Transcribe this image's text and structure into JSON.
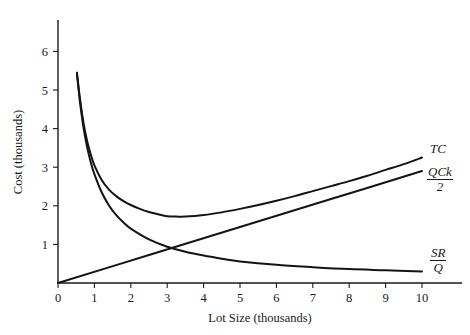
{
  "chart_data": {
    "type": "line",
    "title": "",
    "xlabel": "Lot Size (thousands)",
    "ylabel": "Cost (thousands)",
    "xlim": [
      0,
      11
    ],
    "ylim": [
      0,
      6.7
    ],
    "xticks": [
      "0",
      "1",
      "2",
      "3",
      "4",
      "5",
      "6",
      "7",
      "8",
      "9",
      "10"
    ],
    "yticks": [
      "1",
      "2",
      "3",
      "4",
      "5",
      "6"
    ],
    "grid": false,
    "legend_position": "right-inline",
    "series": [
      {
        "name": "TC",
        "label_text": "TC",
        "label_type": "plain",
        "description": "Total cost: U-shaped sum of holding and setup cost, minimum near lot size 3",
        "x": [
          0.52,
          0.6,
          0.7,
          0.8,
          0.9,
          1.0,
          1.2,
          1.4,
          1.6,
          1.8,
          2.0,
          2.25,
          2.5,
          2.75,
          3.0,
          3.25,
          3.5,
          4.0,
          4.5,
          5.0,
          5.5,
          6.0,
          6.5,
          7.0,
          7.5,
          8.0,
          8.5,
          9.0,
          9.5,
          10.0
        ],
        "y": [
          5.45,
          4.8,
          4.15,
          3.68,
          3.33,
          3.05,
          2.67,
          2.42,
          2.25,
          2.12,
          2.02,
          1.92,
          1.84,
          1.78,
          1.73,
          1.72,
          1.72,
          1.76,
          1.83,
          1.92,
          2.02,
          2.13,
          2.25,
          2.38,
          2.51,
          2.64,
          2.78,
          2.93,
          3.08,
          3.25
        ]
      },
      {
        "name": "QCk/2",
        "label_text": "QCk / 2",
        "label_type": "fraction",
        "label_numerator": "QCk",
        "label_denominator": "2",
        "description": "Holding cost: straight line through origin rising to 2.9 at lot size 10",
        "x": [
          0.0,
          2.5,
          5.0,
          7.5,
          10.0
        ],
        "y": [
          0.0,
          0.725,
          1.45,
          2.175,
          2.9
        ]
      },
      {
        "name": "SR/Q",
        "label_text": "SR / Q",
        "label_type": "fraction",
        "label_numerator": "SR",
        "label_denominator": "Q",
        "description": "Setup cost per unit: hyperbolic decay from 5.4 down to 0.3",
        "x": [
          0.52,
          0.6,
          0.7,
          0.8,
          0.9,
          1.0,
          1.2,
          1.4,
          1.6,
          1.8,
          2.0,
          2.5,
          3.0,
          3.5,
          4.0,
          4.5,
          5.0,
          6.0,
          7.0,
          8.0,
          9.0,
          10.0
        ],
        "y": [
          5.42,
          4.72,
          4.03,
          3.52,
          3.13,
          2.82,
          2.35,
          2.01,
          1.76,
          1.57,
          1.41,
          1.13,
          0.94,
          0.81,
          0.71,
          0.63,
          0.56,
          0.47,
          0.41,
          0.36,
          0.33,
          0.3
        ]
      }
    ],
    "annotations": [
      {
        "name": "tc-curve-label",
        "text": "TC",
        "x": 10.0,
        "y": 3.25
      },
      {
        "name": "holding-cost-label",
        "text": "QCk/2",
        "x": 10.0,
        "y": 2.9
      },
      {
        "name": "setup-cost-label",
        "text": "SR/Q",
        "x": 10.0,
        "y": 0.3
      }
    ]
  },
  "axes": {
    "x_title": "Lot Size (thousands)",
    "y_title": "Cost (thousands)",
    "x_tick_labels": [
      "0",
      "1",
      "2",
      "3",
      "4",
      "5",
      "6",
      "7",
      "8",
      "9",
      "10"
    ],
    "y_tick_labels": [
      "1",
      "2",
      "3",
      "4",
      "5",
      "6"
    ],
    "axis_color": "#1a1a1a"
  },
  "labels": {
    "tc": "TC",
    "qck_numerator": "QCk",
    "qck_denominator": "2",
    "sr_numerator": "SR",
    "sr_denominator": "Q"
  },
  "colors": {
    "background": "#ffffff",
    "ink": "#1a1a1a",
    "curve": "#141414"
  }
}
